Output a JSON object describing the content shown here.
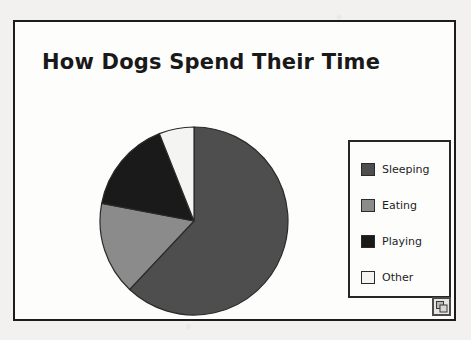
{
  "figure": {
    "title": "How Dogs Spend Their Time",
    "frame_border_color": "#1c1c1c",
    "plot_background": "#fdfdfc",
    "page_background": "#f2f1ef"
  },
  "legend": {
    "position": "right",
    "border_color": "#262626",
    "items": [
      {
        "label": "Sleeping",
        "color": "#4e4e4e",
        "swatch_name": "legend-swatch-sleeping"
      },
      {
        "label": "Eating",
        "color": "#8b8b8b",
        "swatch_name": "legend-swatch-eating"
      },
      {
        "label": "Playing",
        "color": "#1a1a1a",
        "swatch_name": "legend-swatch-playing"
      },
      {
        "label": "Other",
        "color": "#f4f4f2",
        "swatch_name": "legend-swatch-other"
      }
    ]
  },
  "object_handle": {
    "icon": "overlapping-squares-icon",
    "tooltip": "Embedded chart object"
  },
  "chart_data": {
    "type": "pie",
    "title": "How Dogs Spend Their Time",
    "xlabel": "",
    "ylabel": "",
    "grid": false,
    "legend_position": "right",
    "start_angle_deg": 0,
    "direction": "clockwise",
    "categories": [
      "Sleeping",
      "Eating",
      "Playing",
      "Other"
    ],
    "values": [
      62,
      16,
      16,
      6
    ],
    "units": "percent",
    "slices": [
      {
        "label": "Sleeping",
        "value": 62,
        "color": "#4e4e4e",
        "start_deg": 0,
        "end_deg": 223.2
      },
      {
        "label": "Eating",
        "value": 16,
        "color": "#8b8b8b",
        "start_deg": 223.2,
        "end_deg": 280.8
      },
      {
        "label": "Playing",
        "value": 16,
        "color": "#1a1a1a",
        "start_deg": 280.8,
        "end_deg": 338.4
      },
      {
        "label": "Other",
        "value": 6,
        "color": "#f4f4f2",
        "start_deg": 338.4,
        "end_deg": 360
      }
    ],
    "outline_color": "#2b2b2b",
    "radius_px": 94,
    "center": {
      "x": 96,
      "y": 96
    }
  }
}
